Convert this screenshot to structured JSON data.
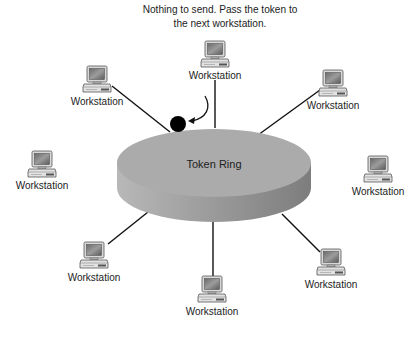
{
  "caption": {
    "line1": "Nothing to send. Pass the token to",
    "line2": "the next workstation."
  },
  "ring": {
    "label": "Token Ring",
    "top_color": "#a9a9a9",
    "side_color": "#8f8f8f"
  },
  "token": {
    "color": "#000000",
    "icon": "token-circle"
  },
  "workstations": [
    {
      "position": "top",
      "label": "Workstation"
    },
    {
      "position": "upper-left",
      "label": "Workstation"
    },
    {
      "position": "upper-right",
      "label": "Workstation"
    },
    {
      "position": "left",
      "label": "Workstation"
    },
    {
      "position": "right",
      "label": "Workstation"
    },
    {
      "position": "lower-left",
      "label": "Workstation"
    },
    {
      "position": "bottom",
      "label": "Workstation"
    },
    {
      "position": "lower-right",
      "label": "Workstation"
    }
  ],
  "icons": {
    "workstation": "computer-icon",
    "arrow": "curved-arrow-icon"
  }
}
